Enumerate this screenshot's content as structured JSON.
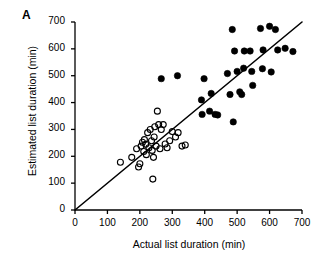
{
  "figure": {
    "panel_label": "A",
    "background_color": "#ffffff",
    "foreground_color": "#000000"
  },
  "chart_data": {
    "type": "scatter",
    "title": "",
    "panel": "A",
    "xlabel": "Actual list duration (min)",
    "ylabel": "Estimated list duration (min)",
    "xlim": [
      0,
      700
    ],
    "ylim": [
      0,
      700
    ],
    "xticks": [
      0,
      100,
      200,
      300,
      400,
      500,
      600,
      700
    ],
    "yticks": [
      0,
      100,
      200,
      300,
      400,
      500,
      600,
      700
    ],
    "xtick_labels": [
      "0",
      "100",
      "200",
      "300",
      "400",
      "500",
      "600",
      "700"
    ],
    "ytick_labels": [
      "0",
      "100",
      "200",
      "300",
      "400",
      "500",
      "600",
      "700"
    ],
    "grid": false,
    "legend": null,
    "annotations": [],
    "reference_line": {
      "name": "identity-line",
      "type": "line",
      "x": [
        0,
        700
      ],
      "y": [
        0,
        700
      ],
      "color": "#000000",
      "width": 1.6
    },
    "series": [
      {
        "name": "Open circles (short lists)",
        "marker": "open-circle",
        "color": "#000000",
        "fill": "none",
        "points": [
          [
            140,
            178
          ],
          [
            175,
            196
          ],
          [
            190,
            228
          ],
          [
            196,
            160
          ],
          [
            200,
            172
          ],
          [
            204,
            238
          ],
          [
            208,
            252
          ],
          [
            212,
            218
          ],
          [
            214,
            262
          ],
          [
            218,
            245
          ],
          [
            220,
            206
          ],
          [
            224,
            288
          ],
          [
            228,
            232
          ],
          [
            232,
            300
          ],
          [
            236,
            258
          ],
          [
            238,
            222
          ],
          [
            240,
            115
          ],
          [
            242,
            196
          ],
          [
            244,
            272
          ],
          [
            246,
            310
          ],
          [
            250,
            238
          ],
          [
            254,
            368
          ],
          [
            258,
            318
          ],
          [
            262,
            228
          ],
          [
            266,
            300
          ],
          [
            272,
            318
          ],
          [
            278,
            246
          ],
          [
            284,
            232
          ],
          [
            292,
            258
          ],
          [
            300,
            292
          ],
          [
            310,
            272
          ],
          [
            318,
            288
          ],
          [
            330,
            238
          ],
          [
            340,
            242
          ]
        ]
      },
      {
        "name": "Filled circles (long lists)",
        "marker": "filled-circle",
        "color": "#000000",
        "fill": "#000000",
        "points": [
          [
            266,
            489
          ],
          [
            316,
            500
          ],
          [
            390,
            410
          ],
          [
            392,
            356
          ],
          [
            398,
            489
          ],
          [
            415,
            368
          ],
          [
            420,
            434
          ],
          [
            432,
            356
          ],
          [
            440,
            354
          ],
          [
            470,
            508
          ],
          [
            478,
            430
          ],
          [
            485,
            672
          ],
          [
            488,
            328
          ],
          [
            492,
            592
          ],
          [
            500,
            516
          ],
          [
            508,
            440
          ],
          [
            514,
            430
          ],
          [
            520,
            528
          ],
          [
            522,
            592
          ],
          [
            540,
            592
          ],
          [
            545,
            516
          ],
          [
            548,
            464
          ],
          [
            572,
            676
          ],
          [
            578,
            526
          ],
          [
            580,
            596
          ],
          [
            600,
            684
          ],
          [
            605,
            514
          ],
          [
            618,
            672
          ],
          [
            625,
            596
          ],
          [
            648,
            602
          ],
          [
            672,
            590
          ]
        ]
      }
    ]
  }
}
